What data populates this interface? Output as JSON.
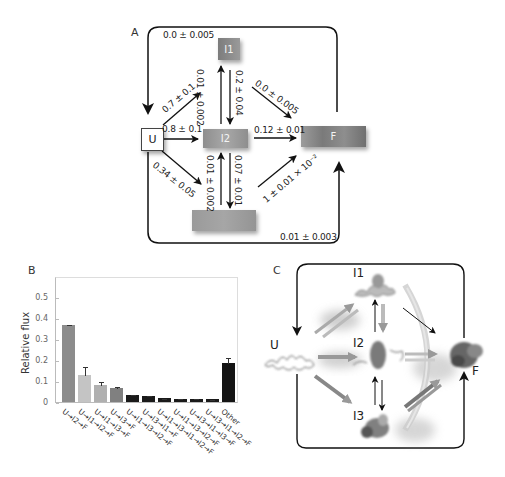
{
  "panels": {
    "a": {
      "label": "A",
      "states": {
        "U": {
          "label": "U",
          "color": "#ffffff"
        },
        "I1": {
          "label": "I1",
          "color": "#8a8a8a"
        },
        "I2": {
          "label": "I2",
          "color": "#9a9a9a"
        },
        "I3": {
          "label": "",
          "color": "#a0a0a0"
        },
        "F": {
          "label": "F",
          "color": "#8c8c8c"
        }
      },
      "rates": {
        "top_loop": "0.0 ± 0.005",
        "u_to_i1": "0.7 ± 0.1",
        "i2_to_i1": "0.01 ± 0.002",
        "i1_to_i2": "0.2 ± 0.04",
        "i1_to_f": "0.0 ± 0.005",
        "u_to_i2": "0.8 ± 0.1",
        "i2_to_f": "0.12 ± 0.01",
        "u_to_i3": "0.34 ± 0.05",
        "i3_to_i2": "0.01 ± 0.002",
        "i2_to_i3": "0.07 ± 0.01",
        "i3_to_f": "1 ± 0.01 × 10⁻²",
        "bottom_loop": "0.01 ± 0.003"
      }
    },
    "b": {
      "label": "B"
    },
    "c": {
      "label": "C",
      "states": {
        "U": "U",
        "I1": "I1",
        "I2": "I2",
        "I3": "I3",
        "F": "F"
      }
    }
  },
  "chart_data": {
    "type": "bar",
    "title": "",
    "xlabel": "",
    "ylabel": "Relative flux",
    "ylim": [
      0,
      0.6
    ],
    "yticks": [
      "0",
      "0.1",
      "0.2",
      "0.3",
      "0.4",
      "0.5"
    ],
    "grid": false,
    "categories": [
      "U→I2→F",
      "U→I1→I2→F",
      "U→I1→I3→F",
      "U→I3→F",
      "U→I1→I3→I2→F",
      "U→I3→I1→F",
      "U→I1→I3→I1→I2→F",
      "U→I1→I3→I2→F",
      "U→I3→I1→I3→F",
      "U→I3→I1→I2→F",
      "Other"
    ],
    "values": [
      0.365,
      0.13,
      0.083,
      0.068,
      0.032,
      0.027,
      0.018,
      0.016,
      0.015,
      0.013,
      0.188
    ],
    "errors": [
      0.005,
      0.04,
      0.015,
      0.01,
      0.005,
      0.008,
      0.003,
      0.003,
      0.003,
      0.003,
      0.028
    ],
    "colors": [
      "#8c8c8c",
      "#c4c4c4",
      "#b0b0b0",
      "#808080",
      "#1a1a1a",
      "#1a1a1a",
      "#1a1a1a",
      "#1a1a1a",
      "#1a1a1a",
      "#1a1a1a",
      "#141414"
    ]
  }
}
